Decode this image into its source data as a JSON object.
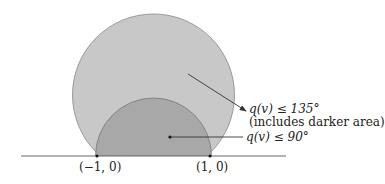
{
  "diagram": {
    "outer_region": {
      "label": "q(v) ≤ 135°",
      "sublabel": "(includes darker area)",
      "fill": "#c8c8c8"
    },
    "inner_region": {
      "label": "q(v) ≤ 90°",
      "fill": "#a8a8a8"
    },
    "points": [
      {
        "label": "(−1, 0)"
      },
      {
        "label": "(1, 0)"
      }
    ],
    "line_color": "#555555"
  }
}
